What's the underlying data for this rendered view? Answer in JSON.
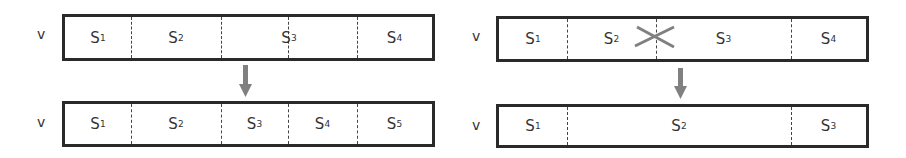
{
  "left": {
    "top_row": {
      "label": "v",
      "segments": [
        {
          "name": "S",
          "sub": "1"
        },
        {
          "name": "S",
          "sub": "2"
        },
        {
          "name": "S",
          "sub": "3"
        },
        {
          "name": "S",
          "sub": "4"
        }
      ]
    },
    "bottom_row": {
      "label": "v",
      "segments": [
        {
          "name": "S",
          "sub": "1"
        },
        {
          "name": "S",
          "sub": "2"
        },
        {
          "name": "S",
          "sub": "3"
        },
        {
          "name": "S",
          "sub": "4"
        },
        {
          "name": "S",
          "sub": "5"
        }
      ]
    }
  },
  "right": {
    "top_row": {
      "label": "v",
      "segments": [
        {
          "name": "S",
          "sub": "1"
        },
        {
          "name": "S",
          "sub": "2"
        },
        {
          "name": "S",
          "sub": "3"
        },
        {
          "name": "S",
          "sub": "4"
        }
      ]
    },
    "bottom_row": {
      "label": "v",
      "segments": [
        {
          "name": "S",
          "sub": "1"
        },
        {
          "name": "S",
          "sub": "2"
        },
        {
          "name": "S",
          "sub": "3"
        }
      ]
    }
  },
  "colors": {
    "arrow": "#808080",
    "cross": "#808080",
    "border": "#2a2a2a"
  }
}
